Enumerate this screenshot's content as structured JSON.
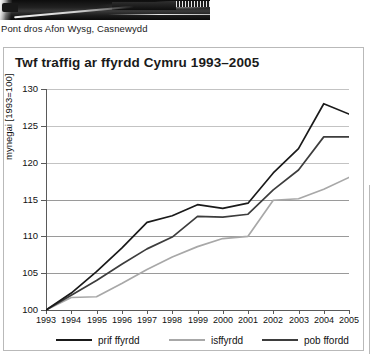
{
  "photo": {
    "alt_name": "motorway-bridge-photo",
    "caption": "Pont dros Afon Wysg, Casnewydd"
  },
  "chart_panel": {
    "title": "Twf traffig ar ffyrdd Cymru 1993–2005"
  },
  "colors": {
    "prif_ffyrdd": "#1a1a1a",
    "isffyrdd": "#a8a8a8",
    "pob_ffordd": "#3d3d3d",
    "gridline": "#9a9a9a",
    "axis": "#5a5a5a",
    "panel_border": "#b9b9b9"
  },
  "legend": {
    "items": [
      {
        "label": "prif ffyrdd",
        "color": "#1a1a1a"
      },
      {
        "label": "isffyrdd",
        "color": "#a8a8a8"
      },
      {
        "label": "pob ffordd",
        "color": "#3d3d3d"
      }
    ]
  },
  "chart_data": {
    "type": "line",
    "title": "Twf traffig ar ffyrdd Cymru 1993–2005",
    "xlabel": "",
    "ylabel": "mynegai [1993=100]",
    "x": [
      1993,
      1994,
      1995,
      1996,
      1997,
      1998,
      1999,
      2000,
      2001,
      2002,
      2003,
      2004,
      2005
    ],
    "categories": [
      "1993",
      "1994",
      "1995",
      "1996",
      "1997",
      "1998",
      "1999",
      "2000",
      "2001",
      "2002",
      "2003",
      "2004",
      "2005"
    ],
    "ylim": [
      100,
      130
    ],
    "yticks": [
      100,
      105,
      110,
      115,
      120,
      125,
      130
    ],
    "ytick_labels": [
      "100",
      "105",
      "110",
      "115",
      "120",
      "125",
      "130"
    ],
    "grid": true,
    "legend_position": "bottom",
    "series": [
      {
        "name": "prif ffyrdd",
        "color": "#1a1a1a",
        "values": [
          100.0,
          102.3,
          105.2,
          108.4,
          111.9,
          112.8,
          114.3,
          113.8,
          114.5,
          118.6,
          121.9,
          128.0,
          126.6
        ]
      },
      {
        "name": "isffyrdd",
        "color": "#a8a8a8",
        "values": [
          100.0,
          101.7,
          101.8,
          103.6,
          105.5,
          107.2,
          108.6,
          109.7,
          110.0,
          114.9,
          115.1,
          116.4,
          118.0
        ]
      },
      {
        "name": "pob ffordd",
        "color": "#3d3d3d",
        "values": [
          100.0,
          102.0,
          104.0,
          106.2,
          108.3,
          109.9,
          112.7,
          112.6,
          113.0,
          116.3,
          119.0,
          123.5,
          123.5
        ]
      }
    ]
  }
}
